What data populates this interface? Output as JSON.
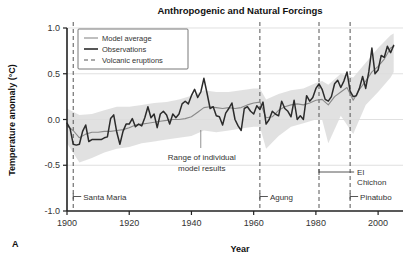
{
  "panel_label": "A",
  "chart_data": {
    "type": "line",
    "title": "Anthropogenic and Natural Forcings",
    "xlabel": "Year",
    "ylabel": "Temperature anomaly (°C)",
    "xlim": [
      1900,
      2008
    ],
    "ylim": [
      -1.0,
      1.0
    ],
    "xticks": [
      1900,
      1920,
      1940,
      1960,
      1980,
      2000
    ],
    "xtick_labels": [
      "1900",
      "1920",
      "1940",
      "1960",
      "1980",
      "2000"
    ],
    "yticks": [
      -1.0,
      -0.5,
      0.0,
      0.5,
      1.0
    ],
    "ytick_labels": [
      "-1.0",
      "-0.5",
      "0.0",
      "0.5",
      "1.0"
    ],
    "grid": "horizontal",
    "legend_position": "top-left",
    "legend": [
      {
        "key": "model-average",
        "label": "Model average",
        "style": "solid-thin-gray",
        "color": "#8a8a8a"
      },
      {
        "key": "observations",
        "label": "Observations",
        "style": "solid-thick-dark",
        "color": "#2b2b2b"
      },
      {
        "key": "volcanic-eruptions",
        "label": "Volcanic eruptions",
        "style": "dashed",
        "color": "#555555"
      }
    ],
    "series": [
      {
        "name": "Observations",
        "color": "#2b2b2b",
        "x": [
          1900,
          1901,
          1902,
          1903,
          1904,
          1905,
          1906,
          1907,
          1908,
          1909,
          1910,
          1911,
          1912,
          1913,
          1914,
          1915,
          1916,
          1917,
          1918,
          1919,
          1920,
          1921,
          1922,
          1923,
          1924,
          1925,
          1926,
          1927,
          1928,
          1929,
          1930,
          1931,
          1932,
          1933,
          1934,
          1935,
          1936,
          1937,
          1938,
          1939,
          1940,
          1941,
          1942,
          1943,
          1944,
          1945,
          1946,
          1947,
          1948,
          1949,
          1950,
          1951,
          1952,
          1953,
          1954,
          1955,
          1956,
          1957,
          1958,
          1959,
          1960,
          1961,
          1962,
          1963,
          1964,
          1965,
          1966,
          1967,
          1968,
          1969,
          1970,
          1971,
          1972,
          1973,
          1974,
          1975,
          1976,
          1977,
          1978,
          1979,
          1980,
          1981,
          1982,
          1983,
          1984,
          1985,
          1986,
          1987,
          1988,
          1989,
          1990,
          1991,
          1992,
          1993,
          1994,
          1995,
          1996,
          1997,
          1998,
          1999,
          2000,
          2001,
          2002,
          2003,
          2004,
          2005
        ],
        "values": [
          -0.04,
          -0.1,
          -0.27,
          -0.28,
          -0.27,
          -0.13,
          -0.06,
          -0.24,
          -0.22,
          -0.22,
          -0.22,
          -0.22,
          -0.2,
          -0.19,
          0.01,
          0.05,
          -0.14,
          -0.27,
          -0.13,
          -0.05,
          -0.05,
          0.01,
          -0.08,
          -0.05,
          -0.07,
          0.02,
          0.14,
          0.02,
          0.06,
          -0.09,
          0.06,
          0.09,
          0.05,
          -0.05,
          0.06,
          0.02,
          0.06,
          0.17,
          0.2,
          0.17,
          0.26,
          0.33,
          0.24,
          0.3,
          0.45,
          0.29,
          0.12,
          0.14,
          0.04,
          0.03,
          -0.06,
          0.07,
          0.12,
          0.18,
          0.0,
          -0.07,
          -0.12,
          0.12,
          0.14,
          0.09,
          0.06,
          0.15,
          0.11,
          0.19,
          -0.05,
          0.0,
          0.09,
          0.06,
          0.04,
          0.2,
          0.12,
          0.09,
          0.03,
          0.21,
          0.0,
          0.04,
          0.0,
          0.26,
          0.2,
          0.24,
          0.34,
          0.39,
          0.33,
          0.22,
          0.2,
          0.25,
          0.39,
          0.43,
          0.35,
          0.42,
          0.52,
          0.31,
          0.25,
          0.26,
          0.34,
          0.47,
          0.34,
          0.52,
          0.78,
          0.5,
          0.54,
          0.7,
          0.68,
          0.8,
          0.73,
          0.81
        ]
      },
      {
        "name": "Model average",
        "color": "#8a8a8a",
        "x": [
          1900,
          1902,
          1904,
          1906,
          1908,
          1910,
          1912,
          1914,
          1916,
          1918,
          1920,
          1922,
          1924,
          1926,
          1928,
          1930,
          1932,
          1934,
          1936,
          1938,
          1940,
          1942,
          1944,
          1946,
          1948,
          1950,
          1952,
          1954,
          1956,
          1958,
          1960,
          1962,
          1964,
          1966,
          1968,
          1970,
          1972,
          1974,
          1976,
          1978,
          1980,
          1982,
          1984,
          1986,
          1988,
          1990,
          1992,
          1994,
          1996,
          1998,
          2000,
          2002,
          2004,
          2005
        ],
        "values": [
          -0.07,
          -0.12,
          -0.2,
          -0.16,
          -0.14,
          -0.14,
          -0.13,
          -0.13,
          -0.12,
          -0.11,
          -0.09,
          -0.06,
          -0.05,
          -0.04,
          -0.03,
          -0.02,
          -0.01,
          0.0,
          0.0,
          0.01,
          0.03,
          0.08,
          0.13,
          0.14,
          0.13,
          0.12,
          0.13,
          0.12,
          0.13,
          0.16,
          0.18,
          0.19,
          0.02,
          0.03,
          0.1,
          0.14,
          0.16,
          0.17,
          0.16,
          0.18,
          0.21,
          0.22,
          0.16,
          0.25,
          0.3,
          0.35,
          0.21,
          0.33,
          0.42,
          0.52,
          0.58,
          0.66,
          0.78,
          0.8
        ]
      }
    ],
    "uncertainty_band": {
      "name": "Range of individual model results",
      "color": "#dcdcdc",
      "x": [
        1900,
        1904,
        1908,
        1912,
        1916,
        1920,
        1924,
        1928,
        1932,
        1936,
        1940,
        1944,
        1948,
        1952,
        1956,
        1960,
        1962,
        1964,
        1968,
        1972,
        1976,
        1980,
        1982,
        1984,
        1988,
        1992,
        1996,
        2000,
        2004,
        2005
      ],
      "upper": [
        0.12,
        0.05,
        0.06,
        0.1,
        0.14,
        0.14,
        0.16,
        0.18,
        0.19,
        0.22,
        0.26,
        0.32,
        0.3,
        0.3,
        0.32,
        0.34,
        0.34,
        0.22,
        0.28,
        0.32,
        0.34,
        0.4,
        0.42,
        0.38,
        0.5,
        0.46,
        0.62,
        0.78,
        0.92,
        0.94
      ],
      "lower": [
        -0.26,
        -0.47,
        -0.42,
        -0.36,
        -0.32,
        -0.3,
        -0.26,
        -0.24,
        -0.22,
        -0.2,
        -0.18,
        -0.12,
        -0.14,
        -0.12,
        -0.1,
        -0.08,
        -0.08,
        -0.32,
        -0.18,
        -0.08,
        -0.04,
        0.0,
        0.0,
        -0.26,
        0.04,
        -0.16,
        0.16,
        0.3,
        0.46,
        0.52
      ]
    },
    "volcanic_eruptions": [
      {
        "name": "Santa Maria",
        "year": 1902,
        "label": "Santa Maria",
        "label_lines": [
          "Santa Maria"
        ]
      },
      {
        "name": "Agung",
        "year": 1962,
        "label": "Agung",
        "label_lines": [
          "Agung"
        ]
      },
      {
        "name": "El Chichon",
        "year": 1981,
        "label": "El Chichon",
        "label_lines": [
          "El",
          "Chichon"
        ]
      },
      {
        "name": "Pinatubo",
        "year": 1991,
        "label": "Pinatubo",
        "label_lines": [
          "Pinatubo"
        ]
      }
    ],
    "annotations": [
      {
        "key": "model-range",
        "lines": [
          "Range of individual",
          "model results"
        ],
        "points_to_year": 1943
      }
    ]
  }
}
